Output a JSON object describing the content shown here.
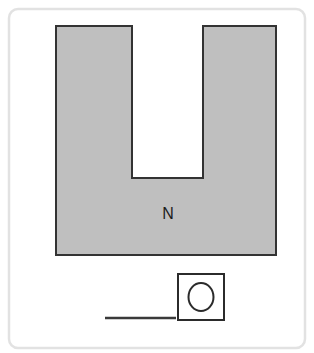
{
  "figure": {
    "background_color": "#ffffff",
    "frame": {
      "name": "figure-border",
      "x": 9,
      "y": 9,
      "width": 296,
      "height": 339,
      "corner_radius": 9,
      "stroke_color": "#e2e2e2",
      "stroke_width": 2.5,
      "fill": "none"
    },
    "magnet": {
      "label": "N",
      "label_x": 168,
      "label_y": 219,
      "fill_color": "#bfbfbf",
      "stroke_color": "#333333",
      "stroke_width": 2,
      "outer_left": 56,
      "outer_right": 276,
      "outer_top": 26,
      "outer_bottom": 255,
      "notch_left": 132,
      "notch_right": 203,
      "notch_bottom": 178,
      "path": "M 56 26 L 132 26 L 132 178 L 203 178 L 203 26 L 276 26 L 276 255 L 56 255 Z"
    },
    "object_box": {
      "name": "square-outline",
      "x": 178,
      "y": 274,
      "width": 46,
      "height": 46,
      "fill_color": "#ffffff",
      "stroke_color": "#2b2b2b",
      "stroke_width": 2
    },
    "object_circle": {
      "name": "circle-outline",
      "center_x": 201,
      "center_y": 297,
      "radius_x": 12.5,
      "radius_y": 14,
      "fill_color": "none",
      "stroke_color": "#2b2b2b",
      "stroke_width": 2
    },
    "baseline": {
      "name": "ground-line",
      "x1": 105,
      "y1": 318,
      "x2": 176,
      "y2": 318,
      "stroke_color": "#3a3a3a",
      "stroke_width": 2.5
    }
  }
}
